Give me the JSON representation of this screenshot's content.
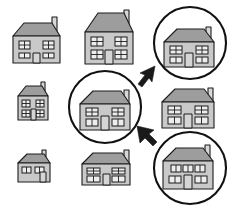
{
  "scene": {
    "title": "Neighbourhood houses selection diagram",
    "background_color": "#ffffff",
    "width": 231,
    "height": 208,
    "colors": {
      "wall": "#c9c9c9",
      "roof": "#9d9d9d",
      "chimney": "#d8d8d8",
      "window": "#ededed",
      "outline": "#1c1c1c",
      "ring": "#111111",
      "arrow": "#1a1a1a"
    }
  },
  "houses": [
    {
      "id": "house-top-left",
      "label": "House top left",
      "row": 1,
      "column": 1,
      "size": "medium",
      "highlighted": false,
      "windows_upper": 2,
      "windows_lower": 2,
      "has_door": true,
      "has_chimney": true,
      "chimney_side": "right"
    },
    {
      "id": "house-top-center",
      "label": "House top center",
      "row": 1,
      "column": 2,
      "size": "large",
      "highlighted": false,
      "windows_upper": 2,
      "windows_lower": 2,
      "has_door": true,
      "has_chimney": true,
      "chimney_side": "right"
    },
    {
      "id": "house-top-right",
      "label": "House top right",
      "row": 1,
      "column": 3,
      "size": "large",
      "highlighted": true,
      "windows_upper": 2,
      "windows_lower": 2,
      "has_door": true,
      "has_chimney": true,
      "chimney_side": "right"
    },
    {
      "id": "house-middle-left",
      "label": "House middle left",
      "row": 2,
      "column": 1,
      "size": "small",
      "highlighted": false,
      "windows_upper": 2,
      "windows_lower": 2,
      "has_door": true,
      "has_chimney": true,
      "chimney_side": "right"
    },
    {
      "id": "house-middle-center",
      "label": "House middle center",
      "row": 2,
      "column": 2,
      "size": "large",
      "highlighted": true,
      "windows_upper": 2,
      "windows_lower": 2,
      "has_door": true,
      "has_chimney": true,
      "chimney_side": "right"
    },
    {
      "id": "house-middle-right",
      "label": "House middle right",
      "row": 2,
      "column": 3,
      "size": "large",
      "highlighted": false,
      "windows_upper": 2,
      "windows_lower": 2,
      "has_door": true,
      "has_chimney": true,
      "chimney_side": "right"
    },
    {
      "id": "house-bottom-left",
      "label": "House bottom left",
      "row": 3,
      "column": 1,
      "size": "small-wide",
      "highlighted": false,
      "windows_upper": 2,
      "windows_lower": 0,
      "has_door": true,
      "has_chimney": true,
      "chimney_side": "right"
    },
    {
      "id": "house-bottom-center",
      "label": "House bottom center",
      "row": 3,
      "column": 2,
      "size": "wide",
      "highlighted": false,
      "windows_upper": 2,
      "windows_lower": 2,
      "has_door": true,
      "has_chimney": true,
      "chimney_side": "right"
    },
    {
      "id": "house-bottom-right",
      "label": "House bottom right",
      "row": 3,
      "column": 3,
      "size": "wide",
      "highlighted": true,
      "windows_upper": 3,
      "windows_lower": 2,
      "has_door": true,
      "has_chimney": true,
      "chimney_side": "right"
    }
  ],
  "highlight_rings": [
    {
      "id": "ring-top-right",
      "target": "house-top-right",
      "cx": 190,
      "cy": 43,
      "r": 36
    },
    {
      "id": "ring-middle-center",
      "target": "house-middle-center",
      "cx": 105,
      "cy": 107,
      "r": 36
    },
    {
      "id": "ring-bottom-right",
      "target": "house-bottom-right",
      "cx": 190,
      "cy": 168,
      "r": 36
    }
  ],
  "arrows": [
    {
      "id": "arrow-to-top-right",
      "from": "house-middle-center",
      "to": "house-top-right",
      "direction": "up-right"
    },
    {
      "id": "arrow-to-middle-center",
      "from": "house-bottom-right",
      "to": "house-middle-center",
      "direction": "up-left"
    }
  ]
}
